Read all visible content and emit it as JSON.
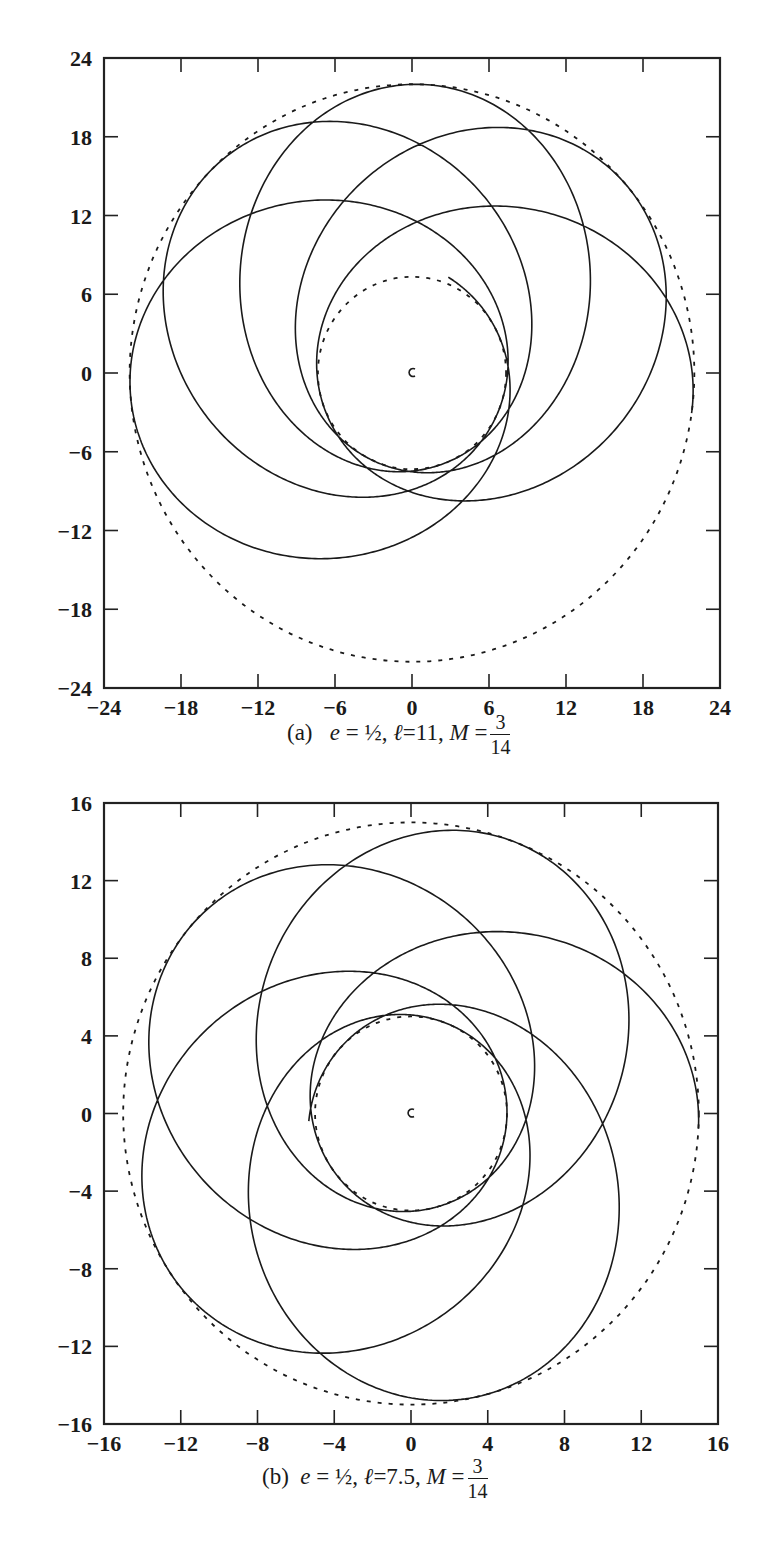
{
  "chart_data": [
    {
      "type": "line",
      "panel": "(a)",
      "title": "",
      "caption": {
        "label": "(a)",
        "e": "½",
        "l": "11",
        "M_num": "3",
        "M_den": "14"
      },
      "xlabel": "",
      "ylabel": "",
      "xlim": [
        -24,
        24
      ],
      "ylim": [
        -24,
        24
      ],
      "xticks": [
        -24,
        -18,
        -12,
        -6,
        0,
        6,
        12,
        18,
        24
      ],
      "yticks": [
        -24,
        -18,
        -12,
        -6,
        0,
        6,
        12,
        18,
        24
      ],
      "xtick_labels": [
        "−24",
        "−18",
        "−12",
        "−6",
        "0",
        "6",
        "12",
        "18",
        "24"
      ],
      "ytick_labels": [
        "−24",
        "−18",
        "−12",
        "−6",
        "0",
        "6",
        "12",
        "18",
        "24"
      ],
      "grid": false,
      "legend": null,
      "series": [
        {
          "name": "orbit",
          "style": "solid",
          "r_min": 7.33,
          "r_max": 22.0,
          "start_angle_deg": -8,
          "precession_per_orbit_deg": 48,
          "num_orbits": 4.6
        },
        {
          "name": "r_max bound",
          "style": "dashed",
          "radius": 22.0
        },
        {
          "name": "r_min bound",
          "style": "dashed",
          "radius": 7.33
        }
      ],
      "center": [
        0,
        0
      ]
    },
    {
      "type": "line",
      "panel": "(b)",
      "title": "",
      "caption": {
        "label": "(b)",
        "e": "½",
        "l": "7.5",
        "M_num": "3",
        "M_den": "14"
      },
      "xlabel": "",
      "ylabel": "",
      "xlim": [
        -16,
        16
      ],
      "ylim": [
        -16,
        16
      ],
      "xticks": [
        -16,
        -12,
        -8,
        -4,
        0,
        4,
        8,
        12,
        16
      ],
      "yticks": [
        -16,
        -12,
        -8,
        -4,
        0,
        4,
        8,
        12,
        16
      ],
      "xtick_labels": [
        "−16",
        "−12",
        "−8",
        "−4",
        "0",
        "4",
        "8",
        "12",
        "16"
      ],
      "ytick_labels": [
        "−16",
        "−12",
        "−8",
        "−4",
        "0",
        "4",
        "8",
        "12",
        "16"
      ],
      "grid": false,
      "legend": null,
      "series": [
        {
          "name": "orbit",
          "style": "solid",
          "r_min": 5.0,
          "r_max": 15.0,
          "start_angle_deg": -3,
          "precession_per_orbit_deg": 72,
          "num_orbits": 4.6
        },
        {
          "name": "r_max bound",
          "style": "dashed",
          "radius": 15.0
        },
        {
          "name": "r_min bound",
          "style": "dashed",
          "radius": 5.0
        }
      ],
      "center": [
        0,
        0
      ]
    }
  ],
  "layout": {
    "a": {
      "x0": 104,
      "x1": 720,
      "y0": 58,
      "y1": 688
    },
    "b": {
      "x0": 104,
      "x1": 718,
      "y0": 23,
      "y1": 644
    }
  }
}
